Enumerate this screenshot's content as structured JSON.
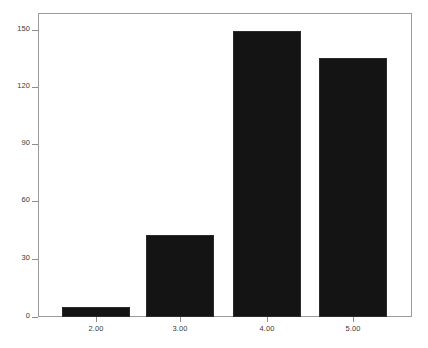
{
  "chart_data": {
    "type": "bar",
    "title": "",
    "subtitle": "",
    "xlabel": "",
    "ylabel": "",
    "categories": [
      "2.00",
      "3.00",
      "4.00",
      "5.00"
    ],
    "values": [
      5,
      43,
      149,
      135
    ],
    "series": [
      {
        "name": "",
        "values": [
          5,
          43,
          149,
          135
        ]
      }
    ],
    "ylim": [
      0,
      158
    ],
    "yticks": [
      0,
      30,
      60,
      90,
      120,
      150
    ],
    "ytick_labels": [
      "0",
      "30",
      "60",
      "90",
      "120",
      "150"
    ],
    "xtick_labels": [
      "2.00",
      "3.00",
      "4.00",
      "5.00"
    ],
    "grid": false,
    "legend": false,
    "legend_position": "none",
    "bar_color": "#141414",
    "axis_color": "#9a9a9a",
    "text_color": "#3a3a3a",
    "background": "#ffffff"
  }
}
